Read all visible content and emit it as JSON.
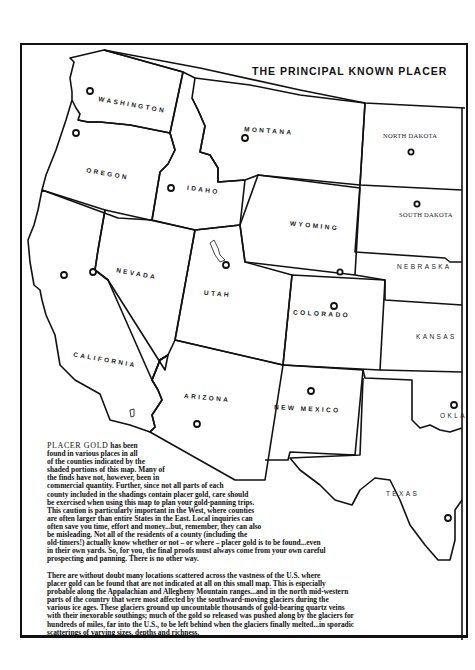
{
  "title": "THE PRINCIPAL KNOWN PLACER",
  "states": [
    {
      "name": "WASHINGTON"
    },
    {
      "name": "OREGON"
    },
    {
      "name": "CALIFORNIA"
    },
    {
      "name": "NEVADA"
    },
    {
      "name": "IDAHO"
    },
    {
      "name": "MONTANA"
    },
    {
      "name": "WYOMING"
    },
    {
      "name": "UTAH"
    },
    {
      "name": "ARIZONA"
    },
    {
      "name": "COLORADO"
    },
    {
      "name": "NEW MEXICO"
    },
    {
      "name": "NORTH DAKOTA"
    },
    {
      "name": "SOUTH DAKOTA"
    },
    {
      "name": "NEBRASKA"
    },
    {
      "name": "KANSAS"
    },
    {
      "name": "OKLA"
    },
    {
      "name": "TEXAS"
    }
  ],
  "text": {
    "p1_lead": "PLACER GOLD",
    "p1_lines": [
      " has been",
      "found in various places in all",
      "of the counties indicated by the",
      "shaded portions of this map. Many of",
      "the finds have not, however, been in",
      "commercial quantity. Further, since not all parts of each",
      "county included in the shadings contain placer gold, care should",
      "be exercised when using this map to plan your gold-panning trips.",
      "This caution is particularly important in the West, where counties",
      "are often larger than entire States in the East. Local inquiries can",
      "often save you time, effort and money...but, remember, they can also",
      "be misleading. Not all of the residents of a county (including the",
      "old-timers!) actually know whether or not – or where – placer gold is to be found...even",
      "in their own yards. So, for you, the final proofs must always come from your own careful",
      "prospecting and panning.   There is no other way."
    ],
    "p2_lines": [
      "There are without doubt many locations scattered across the vastness of the U.S. where",
      "placer gold can be found that are not indicated at all on this small map. This is especially",
      "probable along the Appalachian and Allegheny Mountain ranges...and in the north mid-western",
      "parts of the country that were most affected by the southward-moving glaciers during the",
      "various ice ages. These glaciers ground up uncountable thousands of gold-bearing quartz veins",
      "with their inexorable southings; much of the gold so released was pushed along by the glaciers for",
      "hundreds of miles, far into the U.S., to be left behind when the glaciers finally melted...in sporadic",
      "scatterings of varying sizes, depths and richness."
    ]
  },
  "colors": {
    "ink": "#111111",
    "paper": "#ffffff"
  }
}
